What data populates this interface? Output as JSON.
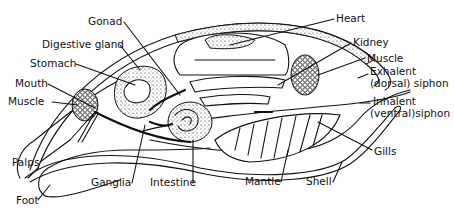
{
  "diagram": {
    "labels": {
      "gonad": "Gonad",
      "digestive_gland": "Digestive gland",
      "stomach": "Stomach",
      "mouth": "Mouth",
      "muscle_anterior": "Muscle",
      "palps": "Palps",
      "foot": "Foot",
      "ganglia": "Ganglia",
      "intestine": "Intestine",
      "heart": "Heart",
      "kidney": "Kidney",
      "muscle_posterior": "Muscle",
      "exhalent_siphon_1": "Exhalent",
      "exhalent_siphon_2": "(dorsal) siphon",
      "inhalent_siphon_1": "Inhalent",
      "inhalent_siphon_2": "(ventral)siphon",
      "gills": "Gills",
      "mantle": "Mantle",
      "shell": "Shell"
    }
  }
}
